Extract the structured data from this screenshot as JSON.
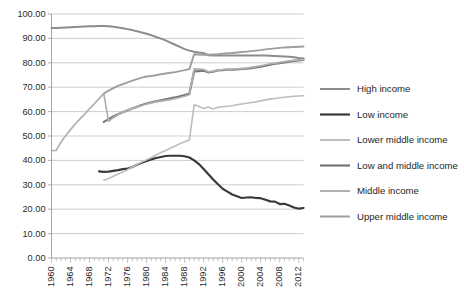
{
  "chart_data": {
    "type": "line",
    "title": "",
    "subtitle": "",
    "xlabel": "",
    "ylabel": "",
    "xlim": [
      1960,
      2013
    ],
    "ylim": [
      0,
      100
    ],
    "grid": true,
    "legend_position": "right",
    "y_ticks": [
      "0.00",
      "10.00",
      "20.00",
      "30.00",
      "40.00",
      "50.00",
      "60.00",
      "70.00",
      "80.00",
      "90.00",
      "100.00"
    ],
    "y_tick_values": [
      0,
      10,
      20,
      30,
      40,
      50,
      60,
      70,
      80,
      90,
      100
    ],
    "x_ticks": [
      "1960",
      "1964",
      "1968",
      "1972",
      "1976",
      "1980",
      "1984",
      "1988",
      "1992",
      "1996",
      "2000",
      "2004",
      "2008",
      "2012"
    ],
    "x_tick_values": [
      1960,
      1964,
      1968,
      1972,
      1976,
      1980,
      1984,
      1988,
      1992,
      1996,
      2000,
      2004,
      2008,
      2012
    ],
    "series": [
      {
        "name": "High income",
        "color": "#8c8c8c",
        "width": 2.0,
        "x": [
          1960,
          1961,
          1962,
          1963,
          1964,
          1965,
          1966,
          1967,
          1968,
          1969,
          1970,
          1971,
          1972,
          1973,
          1974,
          1975,
          1976,
          1977,
          1978,
          1979,
          1980,
          1981,
          1982,
          1983,
          1984,
          1985,
          1986,
          1987,
          1988,
          1989,
          1990,
          1991,
          1992,
          1993,
          1994,
          1995,
          1996,
          1997,
          1998,
          1999,
          2000,
          2001,
          2002,
          2003,
          2004,
          2005,
          2006,
          2007,
          2008,
          2009,
          2010,
          2011,
          2012,
          2013
        ],
        "values": [
          94.3,
          94.3,
          94.4,
          94.5,
          94.6,
          94.7,
          94.8,
          94.9,
          95.0,
          95.0,
          95.1,
          95.1,
          95.0,
          94.8,
          94.5,
          94.2,
          93.8,
          93.4,
          92.9,
          92.4,
          91.9,
          91.3,
          90.6,
          89.9,
          89.2,
          88.3,
          87.4,
          86.5,
          85.6,
          85.0,
          84.5,
          84.2,
          84.0,
          83.1,
          83.0,
          83.0,
          83.0,
          83.0,
          83.0,
          83.0,
          83.0,
          83.0,
          83.0,
          83.0,
          83.0,
          83.0,
          82.9,
          82.8,
          82.7,
          82.6,
          82.5,
          82.3,
          82.0,
          81.8
        ]
      },
      {
        "name": "Low income",
        "color": "#3a3a3a",
        "width": 2.2,
        "x": [
          1970,
          1971,
          1972,
          1973,
          1974,
          1975,
          1976,
          1977,
          1978,
          1979,
          1980,
          1981,
          1982,
          1983,
          1984,
          1985,
          1986,
          1987,
          1988,
          1989,
          1990,
          1991,
          1992,
          1993,
          1994,
          1995,
          1996,
          1997,
          1998,
          1999,
          2000,
          2001,
          2002,
          2003,
          2004,
          2005,
          2006,
          2007,
          2008,
          2009,
          2010,
          2011,
          2012,
          2013
        ],
        "values": [
          35.5,
          35.3,
          35.4,
          35.7,
          36.0,
          36.4,
          36.6,
          37.3,
          38.2,
          39.0,
          39.8,
          40.4,
          41.0,
          41.4,
          41.8,
          41.9,
          41.9,
          41.9,
          41.7,
          41.2,
          40.0,
          38.5,
          36.5,
          34.3,
          32.2,
          30.2,
          28.4,
          27.2,
          26.0,
          25.3,
          24.6,
          24.8,
          24.9,
          24.6,
          24.5,
          23.9,
          23.2,
          23.1,
          22.1,
          22.2,
          21.5,
          20.7,
          20.2,
          20.5
        ]
      },
      {
        "name": "Lower middle income",
        "color": "#bdbdbd",
        "width": 1.6,
        "x": [
          1971,
          1972,
          1973,
          1974,
          1975,
          1976,
          1977,
          1978,
          1979,
          1980,
          1981,
          1982,
          1983,
          1984,
          1985,
          1986,
          1987,
          1988,
          1989,
          1990,
          1991,
          1992,
          1993,
          1994,
          1995,
          1996,
          1997,
          1998,
          1999,
          2000,
          2001,
          2002,
          2003,
          2004,
          2005,
          2006,
          2007,
          2008,
          2009,
          2010,
          2011,
          2012,
          2013
        ],
        "values": [
          31.9,
          32.6,
          33.5,
          34.4,
          35.2,
          36.2,
          37.3,
          38.3,
          39.3,
          40.3,
          41.2,
          42.2,
          43.2,
          44.1,
          45.0,
          45.9,
          46.8,
          47.6,
          48.4,
          62.8,
          62.2,
          61.3,
          61.9,
          61.1,
          61.8,
          62.0,
          62.2,
          62.4,
          62.8,
          63.1,
          63.4,
          63.7,
          64.0,
          64.4,
          64.8,
          65.1,
          65.4,
          65.7,
          65.9,
          66.1,
          66.3,
          66.4,
          66.5
        ]
      },
      {
        "name": "Low and middle income",
        "color": "#777777",
        "width": 2.2,
        "x": [
          1971,
          1972,
          1973,
          1974,
          1975,
          1976,
          1977,
          1978,
          1979,
          1980,
          1981,
          1982,
          1983,
          1984,
          1985,
          1986,
          1987,
          1988,
          1989,
          1990,
          1991,
          1992,
          1993,
          1994,
          1995,
          1996,
          1997,
          1998,
          1999,
          2000,
          2001,
          2002,
          2003,
          2004,
          2005,
          2006,
          2007,
          2008,
          2009,
          2010,
          2011,
          2012,
          2013
        ],
        "values": [
          55.8,
          56.9,
          58.0,
          58.9,
          59.7,
          60.5,
          61.3,
          62.0,
          62.7,
          63.3,
          63.8,
          64.2,
          64.6,
          65.0,
          65.4,
          65.8,
          66.3,
          66.8,
          67.3,
          76.5,
          76.6,
          76.8,
          76.1,
          76.4,
          76.9,
          77.0,
          77.2,
          77.2,
          77.3,
          77.5,
          77.6,
          77.8,
          78.1,
          78.4,
          78.8,
          79.2,
          79.6,
          79.9,
          80.2,
          80.5,
          80.8,
          81.0,
          81.2
        ]
      },
      {
        "name": "Middle income",
        "color": "#b0b0b0",
        "width": 1.7,
        "x": [
          1960,
          1961,
          1962,
          1963,
          1964,
          1965,
          1966,
          1967,
          1968,
          1969,
          1970,
          1971,
          1972,
          1973,
          1974,
          1975,
          1976,
          1977,
          1978,
          1979,
          1980,
          1981,
          1982,
          1983,
          1984,
          1985,
          1986,
          1987,
          1988,
          1989,
          1990,
          1991,
          1992,
          1993,
          1994,
          1995,
          1996,
          1997,
          1998,
          1999,
          2000,
          2001,
          2002,
          2003,
          2004,
          2005,
          2006,
          2007,
          2008,
          2009,
          2010,
          2011,
          2012,
          2013
        ],
        "values": [
          44.0,
          44.1,
          47.5,
          50.2,
          52.6,
          54.9,
          57.0,
          59.0,
          61.2,
          63.2,
          65.3,
          67.4,
          56.0,
          57.5,
          58.7,
          59.7,
          60.5,
          61.2,
          61.9,
          62.5,
          63.1,
          63.6,
          64.0,
          64.3,
          64.6,
          64.9,
          65.3,
          65.8,
          66.3,
          66.9,
          77.5,
          77.4,
          77.3,
          76.3,
          76.6,
          77.0,
          77.2,
          77.3,
          77.4,
          77.5,
          77.6,
          77.8,
          78.1,
          78.4,
          78.8,
          79.2,
          79.6,
          79.9,
          80.2,
          80.5,
          80.8,
          81.0,
          81.2,
          81.3
        ]
      },
      {
        "name": "Upper middle income",
        "color": "#9e9e9e",
        "width": 1.9,
        "x": [
          1971,
          1972,
          1973,
          1974,
          1975,
          1976,
          1977,
          1978,
          1979,
          1980,
          1981,
          1982,
          1983,
          1984,
          1985,
          1986,
          1987,
          1988,
          1989,
          1990,
          1991,
          1992,
          1993,
          1994,
          1995,
          1996,
          1997,
          1998,
          1999,
          2000,
          2001,
          2002,
          2003,
          2004,
          2005,
          2006,
          2007,
          2008,
          2009,
          2010,
          2011,
          2012,
          2013
        ],
        "values": [
          67.4,
          68.6,
          69.6,
          70.5,
          71.3,
          72.0,
          72.7,
          73.3,
          73.9,
          74.4,
          74.6,
          74.9,
          75.3,
          75.6,
          75.9,
          76.2,
          76.6,
          77.0,
          77.4,
          83.5,
          83.4,
          83.3,
          83.3,
          83.4,
          83.5,
          83.7,
          83.9,
          84.0,
          84.2,
          84.4,
          84.6,
          84.8,
          85.0,
          85.2,
          85.5,
          85.7,
          85.9,
          86.1,
          86.3,
          86.4,
          86.5,
          86.6,
          86.7
        ]
      }
    ]
  },
  "legend": {
    "items": [
      {
        "label": "High income"
      },
      {
        "label": "Low income"
      },
      {
        "label": "Lower middle income"
      },
      {
        "label": "Low and middle income"
      },
      {
        "label": "Middle income"
      },
      {
        "label": "Upper middle income"
      }
    ]
  }
}
